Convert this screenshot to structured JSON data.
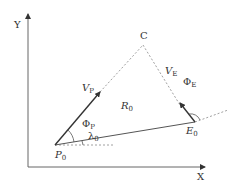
{
  "axes": {
    "x_label": "X",
    "y_label": "Y"
  },
  "points": {
    "intercept": "C",
    "pursuer": {
      "base": "P",
      "sub": "0"
    },
    "evader": {
      "base": "E",
      "sub": "0"
    }
  },
  "vectors": {
    "pursuer_velocity": {
      "base": "V",
      "sub": "P"
    },
    "evader_velocity": {
      "base": "V",
      "sub": "E"
    }
  },
  "lines": {
    "range": {
      "base": "R",
      "sub": "0"
    }
  },
  "angles": {
    "phi_p": {
      "base": "Φ",
      "sub": "P"
    },
    "phi_e": {
      "base": "Φ",
      "sub": "E"
    },
    "lambda": {
      "base": "λ",
      "sub": "0"
    }
  },
  "colors": {
    "line": "#555555",
    "axis": "#666666",
    "dashed": "#888888"
  }
}
